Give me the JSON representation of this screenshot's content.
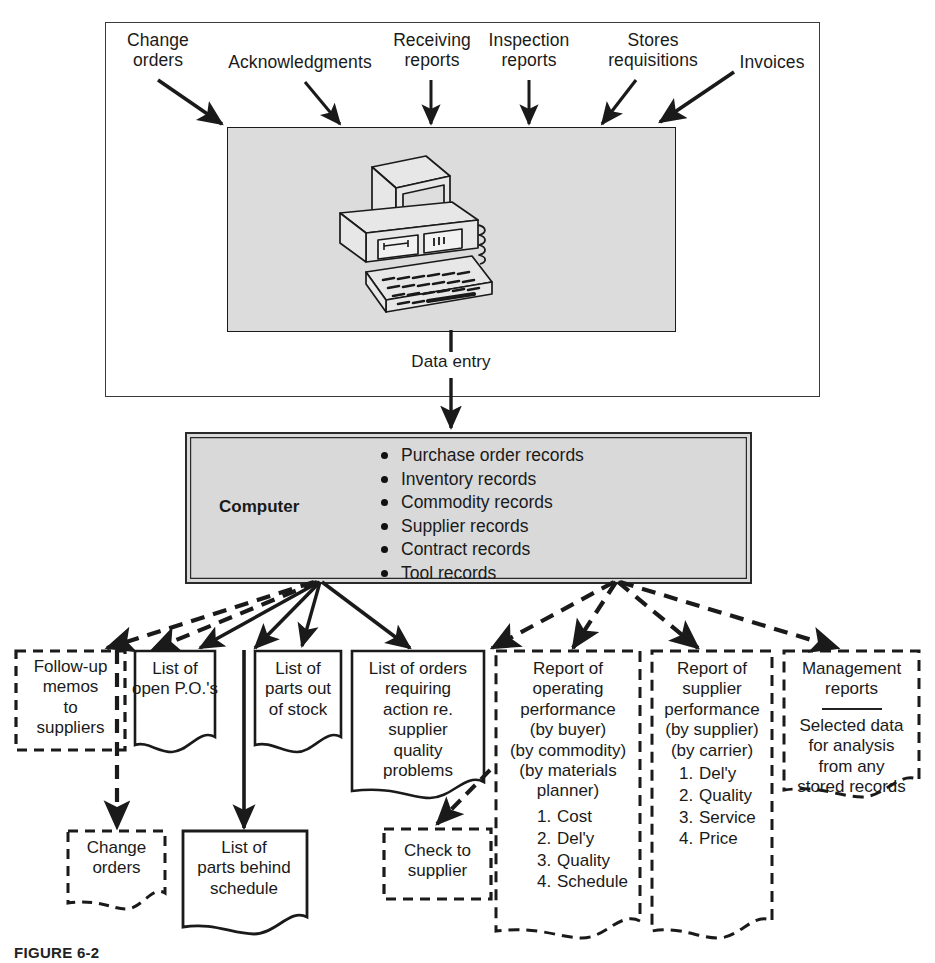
{
  "figure": {
    "caption": "FIGURE 6-2"
  },
  "inputs": {
    "items": [
      {
        "id": "change-orders",
        "label": "Change\norders"
      },
      {
        "id": "acknowledgments",
        "label": "Acknowledgments"
      },
      {
        "id": "receiving-reports",
        "label": "Receiving\nreports"
      },
      {
        "id": "inspection-reports",
        "label": "Inspection\nreports"
      },
      {
        "id": "stores-requisitions",
        "label": "Stores\nrequisitions"
      },
      {
        "id": "invoices",
        "label": "Invoices"
      }
    ]
  },
  "data_entry": {
    "label": "Data entry",
    "icon": "desktop-computer-illustration"
  },
  "computer": {
    "label": "Computer",
    "records": [
      "Purchase order records",
      "Inventory records",
      "Commodity records",
      "Supplier records",
      "Contract records",
      "Tool records"
    ]
  },
  "outputs": {
    "row1": [
      {
        "id": "follow-up-memos",
        "style": "dashed-box",
        "text": "Follow-up\nmemos\nto\nsuppliers"
      },
      {
        "id": "open-pos",
        "style": "solid-document",
        "text": "List of\nopen P.O.'s"
      },
      {
        "id": "parts-out-of-stock",
        "style": "solid-document",
        "text": "List of\nparts out\nof stock"
      },
      {
        "id": "orders-requiring-action",
        "style": "solid-document",
        "text": "List of orders\nrequiring\naction re.\nsupplier\nquality\nproblems"
      },
      {
        "id": "operating-performance",
        "style": "dashed-document",
        "text": "Report of\noperating\nperformance\n(by buyer)\n(by commodity)\n(by materials\nplanner)",
        "numbered": [
          "Cost",
          "Del'y",
          "Quality",
          "Schedule"
        ]
      },
      {
        "id": "supplier-performance",
        "style": "dashed-document",
        "text": "Report of\nsupplier\nperformance\n(by supplier)\n(by carrier)",
        "numbered": [
          "Del'y",
          "Quality",
          "Service",
          "Price"
        ]
      },
      {
        "id": "management-reports",
        "style": "dashed-document",
        "text": "Management\nreports",
        "divider": true,
        "text2": "Selected data\nfor analysis\nfrom any\nstored records"
      }
    ],
    "row2": [
      {
        "id": "change-orders-out",
        "style": "dashed-document",
        "text": "Change\norders"
      },
      {
        "id": "parts-behind-schedule",
        "style": "solid-document",
        "text": "List of\nparts behind\nschedule"
      },
      {
        "id": "check-to-supplier",
        "style": "dashed-box",
        "text": "Check to\nsupplier"
      }
    ]
  },
  "colors": {
    "ink": "#1a1a1a",
    "panel_fill": "#dcdcdc",
    "computer_fill": "#d9d9d9",
    "frame": "#3a3a3a"
  }
}
